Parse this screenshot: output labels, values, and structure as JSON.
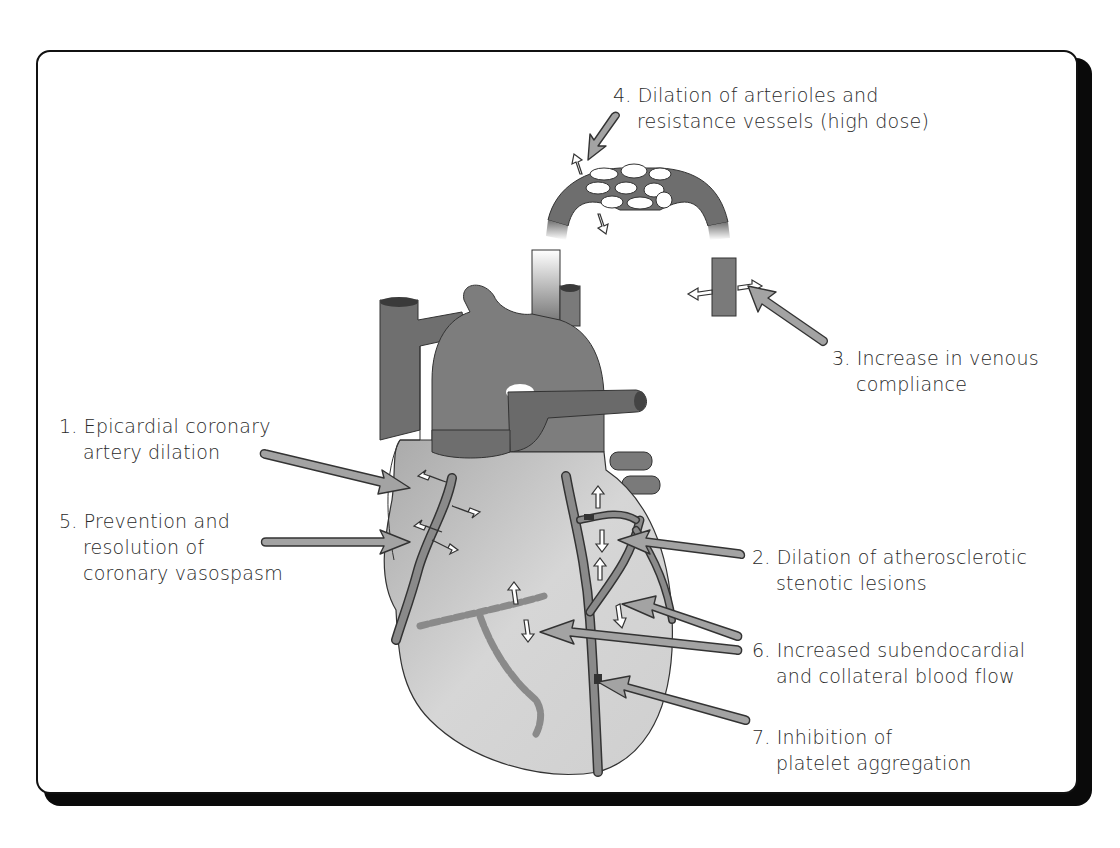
{
  "figure": {
    "colors": {
      "frame_border": "#111111",
      "frame_shadow": "#0a0a0a",
      "vessel_fill": "#7a7a7a",
      "heart_fill": "#c9c9c9",
      "coronary_fill": "#8a8a8a",
      "arrow_fill": "#a0a0a0",
      "arrow_outline": "#333333",
      "text": "#2a2a2a"
    }
  },
  "labels": [
    {
      "id": 1,
      "num": "1.",
      "lines": [
        "Epicardial coronary",
        "artery dilation"
      ]
    },
    {
      "id": 2,
      "num": "2.",
      "lines": [
        "Dilation of atherosclerotic",
        "stenotic lesions"
      ]
    },
    {
      "id": 3,
      "num": "3.",
      "lines": [
        "Increase in venous",
        "compliance"
      ]
    },
    {
      "id": 4,
      "num": "4.",
      "lines": [
        "Dilation of arterioles and",
        "resistance vessels (high dose)"
      ]
    },
    {
      "id": 5,
      "num": "5.",
      "lines": [
        "Prevention and",
        "resolution of",
        "coronary vasospasm"
      ]
    },
    {
      "id": 6,
      "num": "6.",
      "lines": [
        "Increased subendocardial",
        "and collateral blood flow"
      ]
    },
    {
      "id": 7,
      "num": "7.",
      "lines": [
        "Inhibition of",
        "platelet aggregation"
      ]
    }
  ],
  "icons": {
    "pointer_arrow": "large gray outlined arrow",
    "dilation_arrow": "small white outlined double arrow"
  }
}
